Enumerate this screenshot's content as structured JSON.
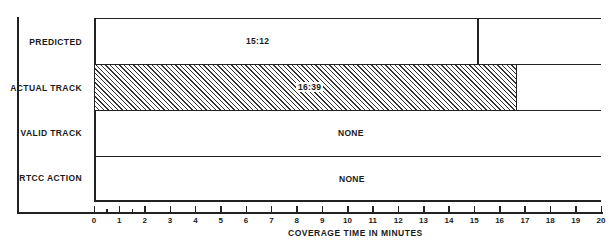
{
  "chart_data": {
    "type": "bar",
    "orientation": "horizontal",
    "title": "",
    "xlabel": "COVERAGE TIME IN MINUTES",
    "ylabel": "",
    "xlim": [
      0,
      20
    ],
    "x_ticks": [
      "0",
      "1",
      "2",
      "3",
      "4",
      "5",
      "6",
      "7",
      "8",
      "9",
      "10",
      "11",
      "12",
      "13",
      "14",
      "15",
      "16",
      "17",
      "18",
      "19",
      "20"
    ],
    "minor_ticks": [
      0.5,
      1.5
    ],
    "grid": false,
    "legend": null,
    "categories": [
      "PREDICTED",
      "ACTUAL TRACK",
      "VALID TRACK",
      "RTCC ACTION"
    ],
    "values": [
      15.2,
      16.65,
      0,
      0
    ],
    "value_labels": [
      "15:12",
      "16:39",
      "NONE",
      "NONE"
    ],
    "bar_styles": [
      "divider-line",
      "hatched",
      "none",
      "none"
    ]
  },
  "rows": [
    {
      "label": "PREDICTED",
      "value_label": "15:12"
    },
    {
      "label": "ACTUAL TRACK",
      "value_label": "16:39"
    },
    {
      "label": "VALID TRACK",
      "value_label": "NONE"
    },
    {
      "label": "RTCC ACTION",
      "value_label": "NONE"
    }
  ],
  "axis": {
    "label": "COVERAGE TIME IN MINUTES",
    "ticks": [
      "0",
      "1",
      "2",
      "3",
      "4",
      "5",
      "6",
      "7",
      "8",
      "9",
      "10",
      "11",
      "12",
      "13",
      "14",
      "15",
      "16",
      "17",
      "18",
      "19",
      "20"
    ]
  }
}
